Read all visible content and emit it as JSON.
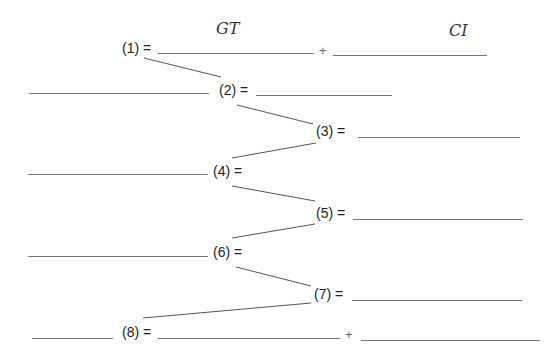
{
  "headers": {
    "left": "GT",
    "right": "CI"
  },
  "operator": "+",
  "equations": [
    {
      "id": "1",
      "label": "(1) ="
    },
    {
      "id": "2",
      "label": "(2) ="
    },
    {
      "id": "3",
      "label": "(3) ="
    },
    {
      "id": "4",
      "label": "(4) ="
    },
    {
      "id": "5",
      "label": "(5) ="
    },
    {
      "id": "6",
      "label": "(6) ="
    },
    {
      "id": "7",
      "label": "(7) ="
    },
    {
      "id": "8",
      "label": "(8) ="
    }
  ],
  "colors": {
    "line": "#777777",
    "connector": "#555555",
    "text": "#222222"
  }
}
